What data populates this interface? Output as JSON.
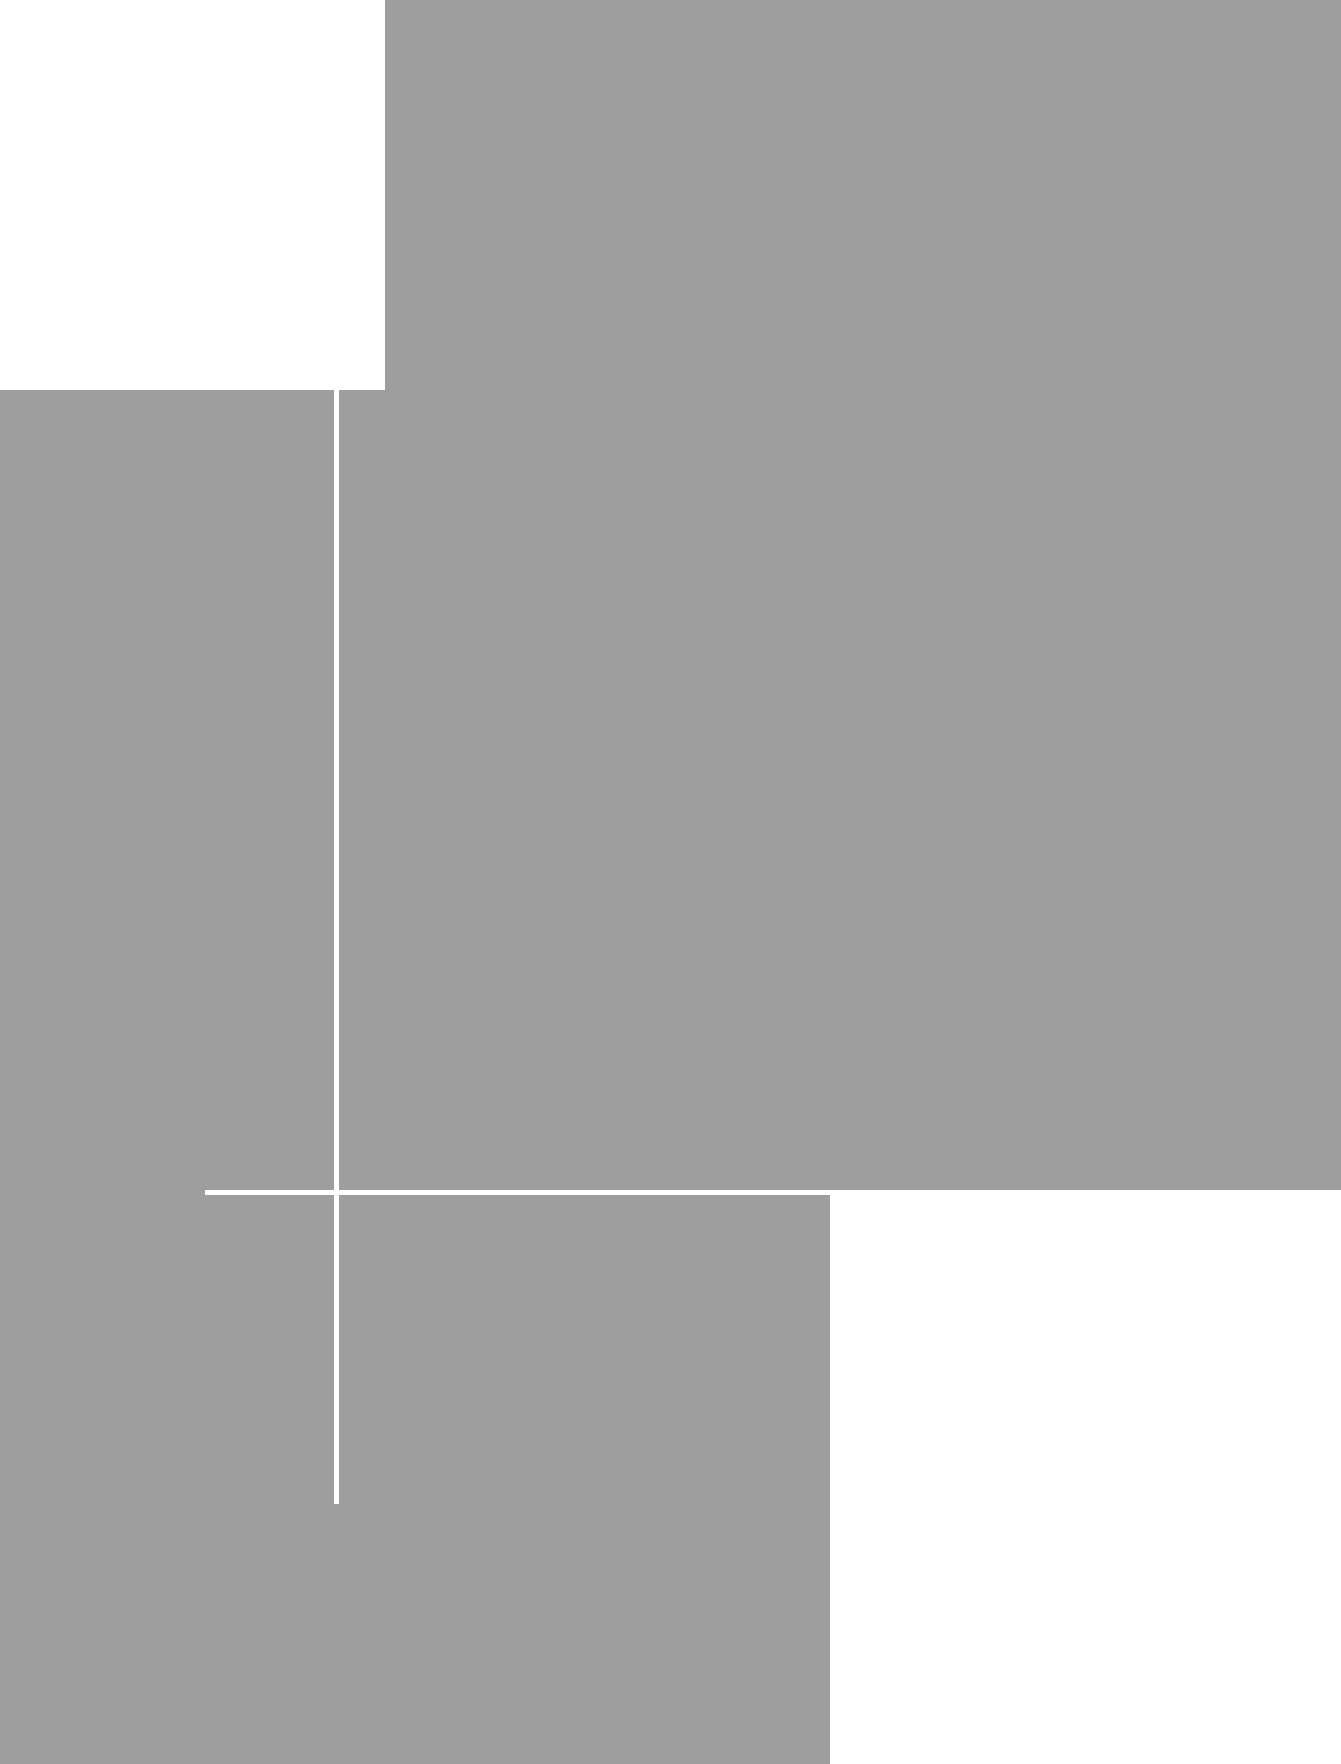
{
  "app": {
    "window_title": "",
    "state_label": "",
    "zoom_level": "",
    "status_text": ""
  },
  "colors": {
    "page_background": "#ffffff",
    "surface_gray": "#9e9e9e",
    "surface_white": "#ffffff",
    "rule_white": "#ffffff"
  },
  "regions": {
    "top_left_plate": {
      "name": "top-left-white-plate",
      "label": "",
      "x": 0,
      "y": 0,
      "width": 385,
      "height": 390
    },
    "main_surface": {
      "name": "main-gray-surface",
      "label": "",
      "x": 337,
      "y": 0,
      "width": 1004,
      "height": 1349
    },
    "left_surface": {
      "name": "left-gray-surface",
      "label": "",
      "x": 0,
      "y": 346,
      "width": 385,
      "height": 1418
    },
    "lower_left_surface": {
      "name": "lower-left-gray-surface",
      "label": "",
      "x": 0,
      "y": 1190,
      "width": 956,
      "height": 574
    },
    "bottom_right_plate": {
      "name": "bottom-right-white-plate",
      "label": "",
      "x": 830,
      "y": 1190,
      "width": 511,
      "height": 574
    }
  },
  "crosshair": {
    "name": "crosshair-guides",
    "vertical_rule": {
      "label": "",
      "x": 334,
      "y": 346,
      "width": 5,
      "height": 1158
    },
    "horizontal_rule": {
      "label": "",
      "x": 205,
      "y": 1190,
      "width": 735,
      "height": 5
    }
  },
  "toolbar": {
    "items": []
  },
  "sidebar": {
    "items": []
  },
  "content": {
    "headings": [],
    "paragraphs": [],
    "values": []
  }
}
